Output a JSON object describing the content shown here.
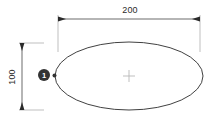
{
  "drawing": {
    "title": "Ellipse dimension drawing",
    "background_color": "#ffffff",
    "line_color": "#2b2b2b",
    "center_mark_color": "#b8b8b8",
    "extension_line_color": "#9a9a9a",
    "callout_fill_color": "#333333",
    "callout_text_color": "#ffffff"
  },
  "shape": {
    "type": "ellipse",
    "center_x": 129,
    "center_y": 76,
    "radius_x": 74,
    "radius_y": 34,
    "center_mark": "+"
  },
  "dimensions": {
    "horizontal": {
      "label": "200",
      "orientation": "horizontal",
      "line_y": 19,
      "start_x": 58,
      "end_x": 200,
      "text_x": 130,
      "text_y": 13
    },
    "vertical": {
      "label": "100",
      "orientation": "vertical",
      "line_x": 22,
      "start_y": 43,
      "end_y": 110,
      "text_x": 15,
      "text_y": 77,
      "rotation": -90
    }
  },
  "callout": {
    "label": "1",
    "circle_x": 44,
    "circle_y": 75,
    "circle_r": 6,
    "point_x": 54.5,
    "point_y": 75.5,
    "point_r": 2
  }
}
